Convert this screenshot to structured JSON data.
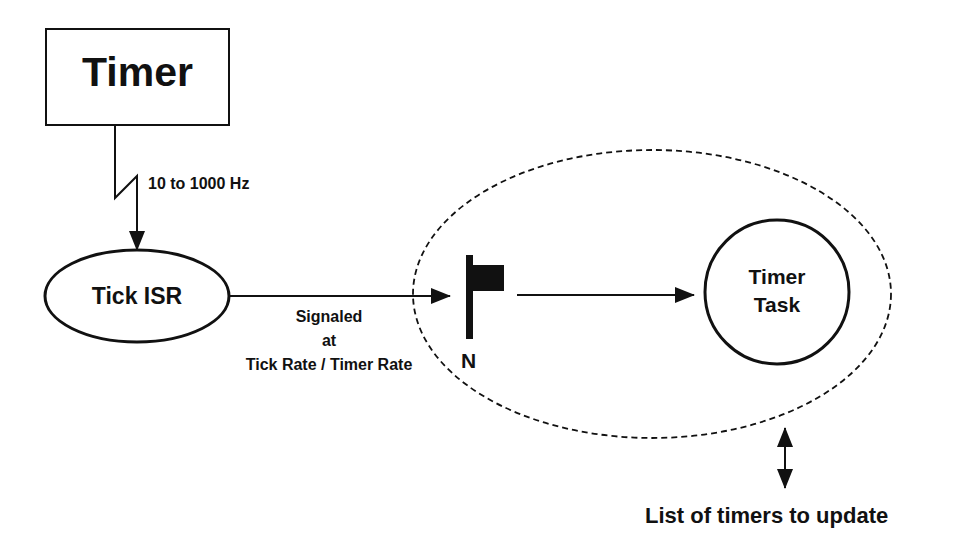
{
  "diagram": {
    "timer_box": {
      "label": "Timer"
    },
    "frequency_label": "10 to 1000 Hz",
    "tick_isr": {
      "label": "Tick ISR"
    },
    "signal_label": {
      "line1": "Signaled",
      "line2": "at",
      "line3": "Tick Rate / Timer Rate"
    },
    "semaphore": {
      "label": "N",
      "icon": "flag-icon"
    },
    "timer_task": {
      "line1": "Timer",
      "line2": "Task"
    },
    "timer_list_label": "List of timers to update",
    "colors": {
      "stroke": "#111111",
      "background": "#ffffff"
    }
  }
}
